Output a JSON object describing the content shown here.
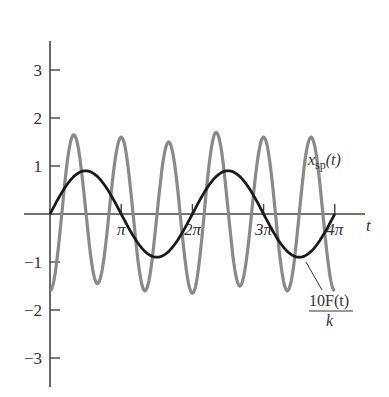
{
  "chart_data": {
    "type": "line",
    "title": "",
    "xlabel": "t",
    "ylabel": "",
    "xlim": [
      0,
      12.566
    ],
    "ylim": [
      -3.5,
      3.6
    ],
    "grid": false,
    "legend": "inline labels",
    "x_ticks": [
      {
        "value": 3.1416,
        "label": "π"
      },
      {
        "value": 6.2832,
        "label": "2π"
      },
      {
        "value": 9.4248,
        "label": "3π"
      },
      {
        "value": 12.5664,
        "label": "4π"
      }
    ],
    "y_ticks": [
      {
        "value": 3,
        "label": "3"
      },
      {
        "value": 2,
        "label": "2"
      },
      {
        "value": 1,
        "label": "1"
      },
      {
        "value": -1,
        "label": "−1"
      },
      {
        "value": -2,
        "label": "−2"
      },
      {
        "value": -3,
        "label": "−3"
      }
    ],
    "series": [
      {
        "name": "x_sp(t)",
        "label_main": "x",
        "label_sub": "sp",
        "label_tail": "(t)",
        "color": "#8a8a8a",
        "description": "Oscillation with frequency ≈3, amplitude ≈1.6 (peaks 1.5–1.7), starting at −1.6",
        "x": [
          0,
          1.047,
          2.094,
          3.142,
          4.189,
          5.236,
          6.283,
          7.33,
          8.378,
          9.425,
          10.472,
          11.519,
          12.566
        ],
        "values": [
          -1.6,
          1.65,
          -1.45,
          1.6,
          -1.6,
          1.5,
          -1.65,
          1.7,
          -1.5,
          1.6,
          -1.6,
          1.6,
          -1.6
        ]
      },
      {
        "name": "10F(t)/k",
        "label_num": "10F(t)",
        "label_den": "k",
        "color": "#1a1a1a",
        "description": "0.9·sin(t)",
        "x": [
          0,
          1.571,
          3.142,
          4.712,
          6.283,
          7.854,
          9.425,
          10.996,
          12.566
        ],
        "values": [
          0,
          0.9,
          0,
          -0.9,
          0,
          0.9,
          0,
          -0.9,
          0
        ]
      }
    ]
  }
}
